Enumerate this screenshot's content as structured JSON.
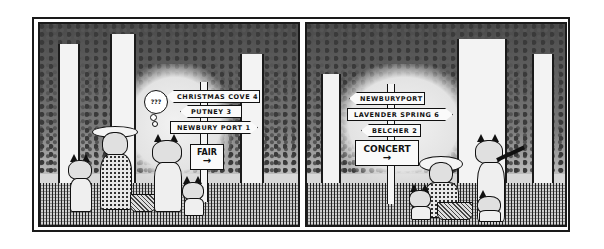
{
  "comic": {
    "type": "two-panel comic strip",
    "style": "black and white pen-and-ink",
    "panels": [
      {
        "index": 1,
        "scene": "forest clearing with signpost; group of animal characters with picnic basket, one puzzled",
        "signs": [
          {
            "text": "CHRISTMAS COVE 4",
            "direction": "left"
          },
          {
            "text": "PUTNEY 3",
            "direction": "left"
          },
          {
            "text": "NEWBURY PORT 1",
            "direction": "right"
          }
        ],
        "board": {
          "text": "FAIR",
          "arrow": "→"
        },
        "thought_bubble": "???"
      },
      {
        "index": 2,
        "scene": "forest clearing with signpost; animal characters at picnic, one gesturing with open arms",
        "signs": [
          {
            "text": "NEWBURYPORT 2",
            "direction": "left"
          },
          {
            "text": "LAVENDER SPRING 6",
            "direction": "right"
          },
          {
            "text": "BELCHER 2",
            "direction": "left"
          }
        ],
        "board": {
          "text": "CONCERT",
          "arrow": "→"
        }
      }
    ]
  }
}
